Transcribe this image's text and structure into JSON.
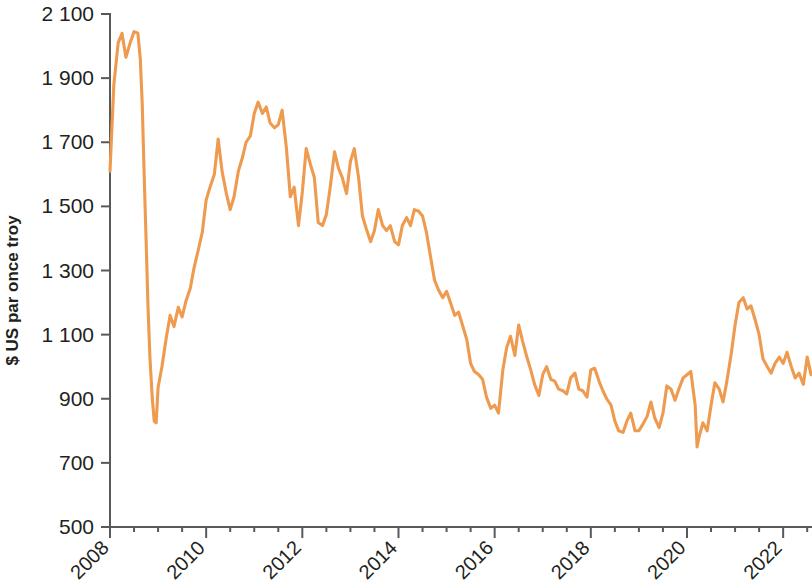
{
  "chart_data": {
    "type": "line",
    "title": "",
    "subtitle": "",
    "xlabel": "",
    "ylabel": "$ US par once troy",
    "xlim": [
      2008.0,
      2022.6
    ],
    "ylim": [
      500,
      2100
    ],
    "grid": false,
    "legend": null,
    "y_ticks": [
      500,
      700,
      900,
      1100,
      1300,
      1500,
      1700,
      1900,
      2100
    ],
    "y_tick_labels": [
      "500",
      "700",
      "900",
      "1 100",
      "1 300",
      "1 500",
      "1 700",
      "1 900",
      "2 100"
    ],
    "x_ticks": [
      2008,
      2010,
      2012,
      2014,
      2016,
      2018,
      2020,
      2022
    ],
    "x_tick_labels": [
      "2008",
      "2010",
      "2012",
      "2014",
      "2016",
      "2018",
      "2020",
      "2022"
    ],
    "x_minor_tick_interval": 0.5,
    "series": [
      {
        "name": "Platine",
        "color": "#EE9B50",
        "x": [
          2008.0,
          2008.08,
          2008.17,
          2008.25,
          2008.33,
          2008.42,
          2008.5,
          2008.58,
          2008.63,
          2008.67,
          2008.71,
          2008.75,
          2008.79,
          2008.83,
          2008.88,
          2008.92,
          2008.96,
          2009.0,
          2009.08,
          2009.17,
          2009.25,
          2009.33,
          2009.42,
          2009.5,
          2009.58,
          2009.67,
          2009.75,
          2009.83,
          2009.92,
          2010.0,
          2010.08,
          2010.17,
          2010.25,
          2010.33,
          2010.42,
          2010.5,
          2010.58,
          2010.67,
          2010.75,
          2010.83,
          2010.92,
          2011.0,
          2011.08,
          2011.17,
          2011.25,
          2011.33,
          2011.42,
          2011.5,
          2011.58,
          2011.67,
          2011.75,
          2011.83,
          2011.92,
          2012.0,
          2012.08,
          2012.17,
          2012.25,
          2012.33,
          2012.42,
          2012.5,
          2012.58,
          2012.67,
          2012.75,
          2012.83,
          2012.92,
          2013.0,
          2013.08,
          2013.17,
          2013.25,
          2013.33,
          2013.42,
          2013.5,
          2013.58,
          2013.67,
          2013.75,
          2013.83,
          2013.92,
          2014.0,
          2014.08,
          2014.17,
          2014.25,
          2014.33,
          2014.42,
          2014.5,
          2014.58,
          2014.67,
          2014.75,
          2014.83,
          2014.92,
          2015.0,
          2015.08,
          2015.17,
          2015.25,
          2015.33,
          2015.42,
          2015.5,
          2015.58,
          2015.67,
          2015.75,
          2015.83,
          2015.92,
          2016.0,
          2016.08,
          2016.17,
          2016.25,
          2016.33,
          2016.42,
          2016.5,
          2016.58,
          2016.67,
          2016.75,
          2016.83,
          2016.92,
          2017.0,
          2017.08,
          2017.17,
          2017.25,
          2017.33,
          2017.42,
          2017.5,
          2017.58,
          2017.67,
          2017.75,
          2017.83,
          2017.92,
          2018.0,
          2018.08,
          2018.17,
          2018.25,
          2018.33,
          2018.42,
          2018.5,
          2018.58,
          2018.67,
          2018.75,
          2018.83,
          2018.92,
          2019.0,
          2019.08,
          2019.17,
          2019.25,
          2019.33,
          2019.42,
          2019.5,
          2019.58,
          2019.67,
          2019.75,
          2019.83,
          2019.92,
          2020.0,
          2020.08,
          2020.17,
          2020.21,
          2020.25,
          2020.33,
          2020.42,
          2020.5,
          2020.58,
          2020.67,
          2020.75,
          2020.83,
          2020.92,
          2021.0,
          2021.08,
          2021.17,
          2021.25,
          2021.33,
          2021.42,
          2021.5,
          2021.58,
          2021.67,
          2021.75,
          2021.83,
          2021.92,
          2022.0,
          2022.08,
          2022.17,
          2022.25,
          2022.33,
          2022.42,
          2022.5,
          2022.58
        ],
        "y": [
          1610,
          1880,
          2010,
          2040,
          1965,
          2010,
          2045,
          2040,
          1960,
          1820,
          1600,
          1400,
          1190,
          1030,
          900,
          830,
          825,
          935,
          1000,
          1090,
          1160,
          1125,
          1185,
          1155,
          1205,
          1245,
          1310,
          1360,
          1420,
          1520,
          1560,
          1600,
          1710,
          1610,
          1540,
          1490,
          1530,
          1610,
          1650,
          1700,
          1720,
          1790,
          1825,
          1790,
          1810,
          1760,
          1745,
          1755,
          1800,
          1680,
          1530,
          1560,
          1440,
          1545,
          1680,
          1630,
          1590,
          1450,
          1440,
          1475,
          1560,
          1670,
          1620,
          1590,
          1540,
          1640,
          1680,
          1590,
          1470,
          1430,
          1390,
          1425,
          1490,
          1440,
          1425,
          1440,
          1390,
          1380,
          1440,
          1465,
          1440,
          1490,
          1485,
          1470,
          1420,
          1340,
          1270,
          1240,
          1215,
          1235,
          1200,
          1160,
          1170,
          1130,
          1085,
          1010,
          985,
          975,
          960,
          905,
          870,
          880,
          855,
          990,
          1060,
          1095,
          1035,
          1130,
          1080,
          1030,
          990,
          945,
          910,
          975,
          1000,
          960,
          955,
          930,
          925,
          915,
          965,
          980,
          930,
          925,
          905,
          990,
          995,
          955,
          925,
          900,
          880,
          830,
          800,
          795,
          830,
          855,
          800,
          800,
          820,
          845,
          890,
          840,
          810,
          855,
          940,
          930,
          895,
          930,
          965,
          975,
          985,
          880,
          750,
          780,
          825,
          800,
          880,
          950,
          930,
          890,
          955,
          1040,
          1130,
          1200,
          1215,
          1180,
          1190,
          1145,
          1100,
          1025,
          1000,
          980,
          1010,
          1030,
          1010,
          1045,
          1000,
          965,
          980,
          945,
          1030,
          975
        ]
      }
    ]
  },
  "axis": {
    "y_title": "$ US par once troy"
  },
  "plot_geometry": {
    "left": 110,
    "right": 812,
    "top": 14,
    "bottom": 527
  }
}
